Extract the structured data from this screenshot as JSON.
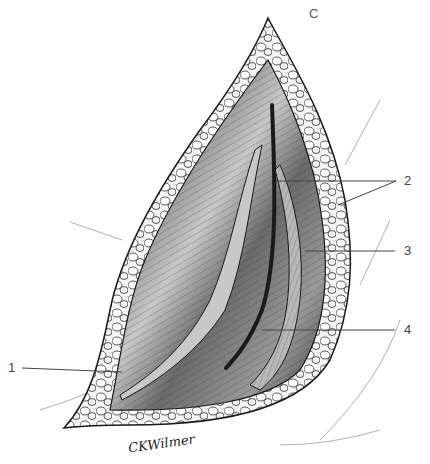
{
  "figure": {
    "panel_letter": "C",
    "signature": "CKWilmer",
    "colors": {
      "outline": "#1a1a1a",
      "fat_fill": "#e8e8e8",
      "muscle_dark": "#3a3a3a",
      "muscle_mid": "#7a7a7a",
      "muscle_light": "#b5b5b5",
      "leader_line": "#444444",
      "skin_line": "#9a9a9a"
    },
    "labels": [
      {
        "id": "1",
        "text": "1"
      },
      {
        "id": "2",
        "text": "2"
      },
      {
        "id": "3",
        "text": "3"
      },
      {
        "id": "4",
        "text": "4"
      }
    ]
  }
}
